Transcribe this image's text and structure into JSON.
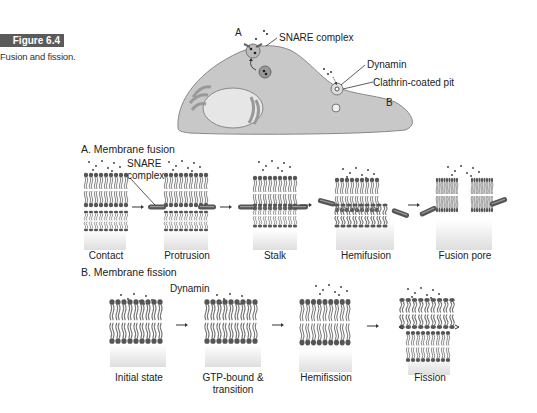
{
  "figure": {
    "number_label": "Figure 6.4",
    "caption": "Fusion and fission.",
    "badge_color": "#5a5a5a"
  },
  "cell_diagram": {
    "labels": {
      "site_a": "A",
      "site_b": "B",
      "snare_complex": "SNARE complex",
      "dynamin": "Dynamin",
      "clathrin_pit": "Clathrin-coated pit"
    },
    "cell_fill": "#c8c8c8"
  },
  "fusion": {
    "title": "A. Membrane fusion",
    "snare_label_line1": "SNARE",
    "snare_label_line2": "complex",
    "stages": [
      "Contact",
      "Protrusion",
      "Stalk",
      "Hemifusion",
      "Fusion pore"
    ]
  },
  "fission": {
    "title": "B. Membrane fission",
    "dynamin_label": "Dynamin",
    "stages": [
      "Initial state",
      "GTP-bound &",
      "Hemifission",
      "Fission"
    ],
    "stage2_line2": "transition"
  }
}
